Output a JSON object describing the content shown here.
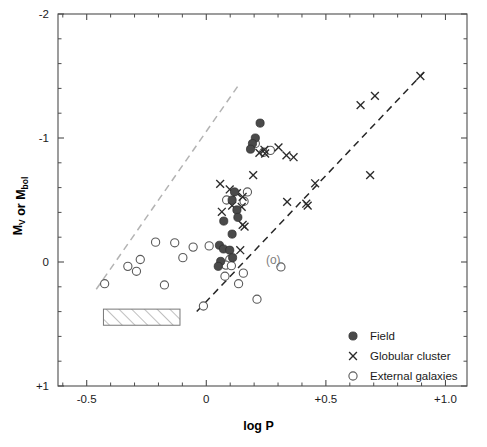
{
  "chart_data": {
    "type": "scatter",
    "title": "",
    "xlabel": "log P",
    "ylabel": "M_V or M_bol",
    "ylabel_parts": [
      {
        "text": "M",
        "sub": "V"
      },
      {
        "text": " or M",
        "sub": "bol"
      }
    ],
    "xlim": [
      -0.62,
      1.09
    ],
    "ylim": [
      -2.0,
      1.0
    ],
    "y_inverted": true,
    "grid": false,
    "xticks": [
      -0.5,
      0.0,
      0.5,
      1.0
    ],
    "xticklabels": [
      "-0.5",
      "0",
      "+0.5",
      "+1.0"
    ],
    "yticks": [
      -2.0,
      -1.0,
      0.0,
      1.0
    ],
    "yticklabels": [
      "-2",
      "-1",
      "0",
      "+1"
    ],
    "x_minor_step": 0.1,
    "y_minor_step": 0.2,
    "legend": {
      "position": "lower-right-inside",
      "entries": [
        {
          "label": "Field",
          "marker": "filled-circle"
        },
        {
          "label": "Globular cluster",
          "marker": "cross"
        },
        {
          "label": "External galaxies",
          "marker": "open-circle"
        }
      ]
    },
    "annotations": [
      {
        "text": "(o)",
        "x": 0.28,
        "y": -0.02,
        "color": "#808080"
      }
    ],
    "shaded_region": {
      "label": "hatched-box",
      "x0": -0.43,
      "x1": -0.11,
      "y0": 0.38,
      "y1": 0.51,
      "style": "diagonal-hatch"
    },
    "fit_lines": [
      {
        "name": "upper-relation",
        "color": "#b3b3b3",
        "style": "dashed",
        "x0": -0.46,
        "y0": 0.22,
        "x1": 0.14,
        "y1": -1.44
      },
      {
        "name": "lower-relation",
        "color": "#262626",
        "style": "dashed",
        "x0": -0.04,
        "y0": 0.4,
        "x1": 0.91,
        "y1": -1.53
      }
    ],
    "series": [
      {
        "name": "Field",
        "marker": "filled-circle",
        "color": "#4a4a4a",
        "points": [
          [
            0.225,
            -1.12
          ],
          [
            0.205,
            -1.0
          ],
          [
            0.193,
            -0.955
          ],
          [
            0.185,
            -0.91
          ],
          [
            0.118,
            -0.565
          ],
          [
            0.108,
            -0.5
          ],
          [
            0.128,
            -0.42
          ],
          [
            0.132,
            -0.36
          ],
          [
            0.073,
            -0.33
          ],
          [
            0.108,
            -0.225
          ],
          [
            0.055,
            -0.135
          ],
          [
            0.072,
            -0.105
          ],
          [
            0.098,
            -0.095
          ],
          [
            0.11,
            -0.035
          ],
          [
            0.06,
            -0.005
          ],
          [
            0.05,
            0.035
          ]
        ]
      },
      {
        "name": "Globular cluster",
        "marker": "cross",
        "color": "#2b2b2b",
        "points": [
          [
            0.895,
            -1.5
          ],
          [
            0.705,
            -1.34
          ],
          [
            0.645,
            -1.265
          ],
          [
            0.222,
            -0.88
          ],
          [
            0.246,
            -0.875
          ],
          [
            0.302,
            -0.925
          ],
          [
            0.243,
            -0.905
          ],
          [
            0.335,
            -0.86
          ],
          [
            0.365,
            -0.845
          ],
          [
            0.685,
            -0.7
          ],
          [
            0.455,
            -0.635
          ],
          [
            0.196,
            -0.7
          ],
          [
            0.098,
            -0.585
          ],
          [
            0.128,
            -0.555
          ],
          [
            0.152,
            -0.525
          ],
          [
            0.108,
            -0.455
          ],
          [
            0.148,
            -0.445
          ],
          [
            0.338,
            -0.485
          ],
          [
            0.418,
            -0.47
          ],
          [
            0.424,
            -0.455
          ],
          [
            0.065,
            -0.405
          ],
          [
            0.152,
            -0.3
          ],
          [
            0.16,
            -0.285
          ],
          [
            0.142,
            -0.095
          ],
          [
            0.058,
            -0.63
          ]
        ]
      },
      {
        "name": "External galaxies",
        "marker": "open-circle",
        "color": "#5a5a5a",
        "points": [
          [
            0.24,
            -0.885
          ],
          [
            0.268,
            -0.9
          ],
          [
            0.205,
            -0.955
          ],
          [
            0.172,
            -0.565
          ],
          [
            0.085,
            -0.5
          ],
          [
            0.158,
            -0.49
          ],
          [
            -0.212,
            -0.16
          ],
          [
            -0.132,
            -0.155
          ],
          [
            -0.055,
            -0.12
          ],
          [
            0.012,
            -0.13
          ],
          [
            -0.098,
            -0.035
          ],
          [
            -0.276,
            -0.02
          ],
          [
            -0.328,
            0.035
          ],
          [
            -0.292,
            0.075
          ],
          [
            -0.425,
            0.175
          ],
          [
            -0.175,
            0.185
          ],
          [
            0.098,
            -0.02
          ],
          [
            0.082,
            0.025
          ],
          [
            0.105,
            0.03
          ],
          [
            0.078,
            0.115
          ],
          [
            0.155,
            0.09
          ],
          [
            0.135,
            0.175
          ],
          [
            0.212,
            0.3
          ],
          [
            -0.012,
            0.355
          ],
          [
            0.312,
            0.04
          ]
        ]
      }
    ]
  }
}
